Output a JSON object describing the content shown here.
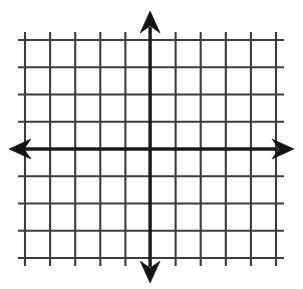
{
  "figure": {
    "width": 303,
    "height": 289,
    "background_color": "#ffffff",
    "grid_line_color": "#3c3c3c",
    "axis_line_color": "#1a1a1a",
    "arrow_color": "#121212"
  },
  "chart_data": {
    "type": "scatter",
    "title": "",
    "subtitle": "",
    "xlabel": "",
    "ylabel": "",
    "grid": true,
    "legend": false,
    "legend_position": "none",
    "annotations": [],
    "series": [],
    "x": [],
    "values": [],
    "xlim": [
      -5,
      5
    ],
    "ylim": [
      -4,
      4
    ],
    "x_tick_labels": [],
    "y_tick_labels": [],
    "x_major_step": 1,
    "y_major_step": 1,
    "x_gridline_count": 11,
    "y_gridline_count": 9,
    "origin_x_index": 5,
    "origin_y_index": 4,
    "axes_have_arrows": true,
    "axis_arrow_directions": [
      "up",
      "down",
      "left",
      "right"
    ]
  },
  "geometry": {
    "grid_left": 25,
    "grid_right": 276,
    "grid_top": 40,
    "grid_bottom": 258,
    "vertical_overhang_top": 32,
    "vertical_overhang_bottom": 266,
    "horizontal_overhang_left": 18,
    "horizontal_overhang_right": 284,
    "origin_x": 150.1,
    "origin_y": 149,
    "x_spacing": 25.1,
    "y_spacing": 27.25,
    "y_axis_arrow_tip_top": 11,
    "y_axis_arrow_tip_bottom": 283,
    "x_axis_arrow_tip_left": 9,
    "x_axis_arrow_tip_right": 294,
    "arrow_half_width": 10,
    "arrow_length": 22
  },
  "vertical_gridlines": [
    25.0,
    50.1,
    75.2,
    100.3,
    125.4,
    150.1,
    175.6,
    200.7,
    225.8,
    250.9,
    276.0
  ],
  "horizontal_gridlines": [
    40.0,
    67.25,
    94.5,
    121.75,
    149.0,
    176.25,
    203.5,
    230.75,
    258.0
  ]
}
